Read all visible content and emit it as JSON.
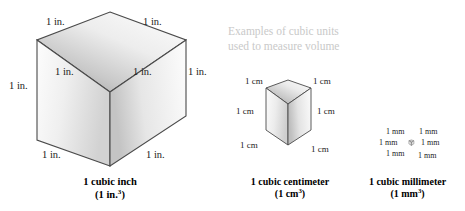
{
  "figure": {
    "title": "Examples of cubic units used to measure volume",
    "background_color": "#ffffff"
  },
  "note": {
    "line1": "Examples of cubic units",
    "line2": "used to measure volume",
    "color": "#c9c9c9"
  },
  "cubes": [
    {
      "id": "cubic-inch",
      "unit": "in.",
      "label": "1 in.",
      "caption_line1": "1 cubic inch",
      "caption_line2_prefix": "(1 in.",
      "caption_line2_exponent": "3",
      "caption_line2_suffix": ")",
      "edge_labels": [
        "1 in.",
        "1 in.",
        "1 in.",
        "1 in.",
        "1 in.",
        "1 in.",
        "1 in."
      ]
    },
    {
      "id": "cubic-centimeter",
      "unit": "cm",
      "label": "1 cm",
      "caption_line1": "1 cubic centimeter",
      "caption_line2_prefix": "(1 cm",
      "caption_line2_exponent": "3",
      "caption_line2_suffix": ")",
      "edge_labels": [
        "1 cm",
        "1 cm",
        "1 cm",
        "1 cm",
        "1 cm",
        "1 cm"
      ]
    },
    {
      "id": "cubic-millimeter",
      "unit": "mm",
      "label": "1 mm",
      "caption_line1": "1 cubic millimeter",
      "caption_line2_prefix": "(1 mm",
      "caption_line2_exponent": "3",
      "caption_line2_suffix": ")",
      "edge_labels": [
        "1 mm",
        "1 mm",
        "1 mm",
        "1 mm",
        "1 mm",
        "1 mm"
      ]
    }
  ],
  "colors": {
    "outline": "#4a4a4a",
    "top_face_light": "#fbfbfb",
    "top_face_dark": "#a8a8a8",
    "left_face_light": "#fdfdfd",
    "left_face_dark": "#cfcfcf",
    "right_face_light": "#fefefe",
    "right_face_dark": "#c2c2c2",
    "text": "#1a1a1a"
  }
}
